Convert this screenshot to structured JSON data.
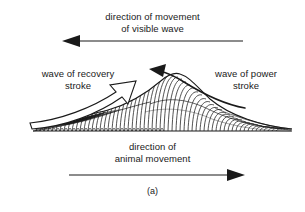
{
  "figure": {
    "caption": "(a)",
    "background_color": "#ffffff",
    "ink_color": "#1a1a1a",
    "labels": {
      "top_direction": "direction of movement\nof visible wave",
      "recovery_stroke": "wave of recovery\nstroke",
      "power_stroke": "wave of power\nstroke",
      "bottom_direction": "direction of\nanimal movement"
    },
    "arrows": {
      "top": {
        "name": "direction-of-visible-wave-arrow",
        "direction": "left",
        "style": "solid-head",
        "x_start": 243,
        "x_end": 62,
        "y": 41
      },
      "bottom": {
        "name": "direction-of-animal-movement-arrow",
        "direction": "right",
        "style": "solid-head",
        "x_start": 69,
        "x_end": 245,
        "y": 175
      },
      "recovery": {
        "name": "recovery-stroke-arrow",
        "direction": "up-right",
        "style": "hollow-outline-curved"
      },
      "power": {
        "name": "power-stroke-arrow",
        "direction": "left-over-crest",
        "style": "solid-head-curved"
      }
    },
    "wave": {
      "name": "metachronal-leg-wave",
      "baseline_y": 130,
      "baseline_x_start": 33,
      "baseline_x_end": 292,
      "crest_x": 168,
      "crest_y": 78,
      "leg_count": 58
    }
  }
}
